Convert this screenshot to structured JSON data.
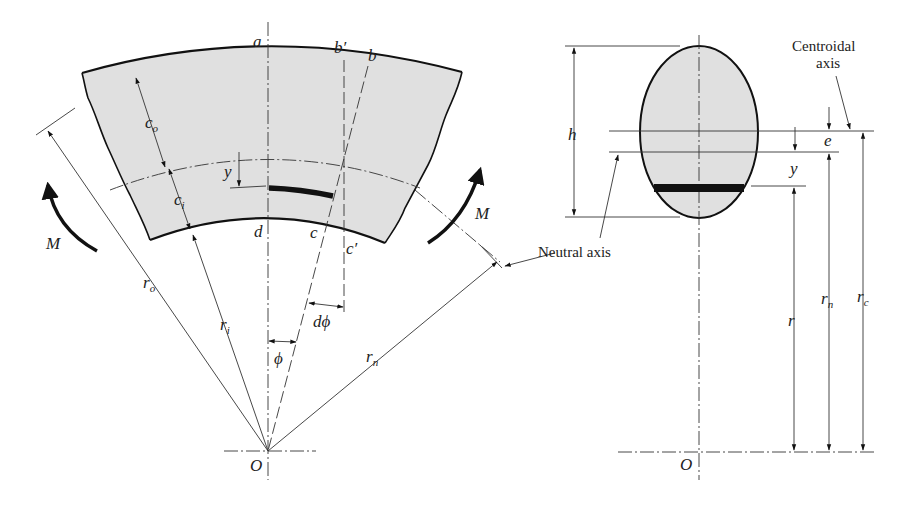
{
  "figure": {
    "fill_color": "#e0e0e0",
    "line_color": "#111111"
  },
  "left_view": {
    "points": {
      "a": "a",
      "b_prime": "b′",
      "b": "b",
      "d": "d",
      "c": "c",
      "c_prime": "c′",
      "origin": "O"
    },
    "dimensions": {
      "c_o": {
        "main": "c",
        "sub": "o"
      },
      "c_i": {
        "main": "c",
        "sub": "i"
      },
      "y": "y",
      "r_o": {
        "main": "r",
        "sub": "o"
      },
      "r_i": {
        "main": "r",
        "sub": "i"
      },
      "r_n": {
        "main": "r",
        "sub": "n"
      },
      "phi": "ϕ",
      "dphi": "dϕ"
    },
    "moments": {
      "left": "M",
      "right": "M"
    },
    "annotations": {
      "neutral_axis": "Neutral axis"
    }
  },
  "right_view": {
    "dimensions": {
      "h": "h",
      "e": "e",
      "y": "y",
      "r": "r",
      "r_n": {
        "main": "r",
        "sub": "n"
      },
      "r_c": {
        "main": "r",
        "sub": "c"
      }
    },
    "origin": "O",
    "annotations": {
      "centroidal_axis_line1": "Centroidal",
      "centroidal_axis_line2": "axis"
    }
  }
}
